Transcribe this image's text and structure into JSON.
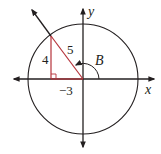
{
  "diagram": {
    "type": "unit-circle-reference-triangle",
    "colors": {
      "axis": "#231f20",
      "circle": "#231f20",
      "triangle": "#b5323a",
      "text": "#231f20"
    },
    "axes": {
      "x_label": "x",
      "y_label": "y"
    },
    "angle": {
      "label": "B",
      "quadrant": "II"
    },
    "triangle": {
      "opposite_label": "4",
      "adjacent_label": "−3",
      "hypotenuse_label": "5",
      "right_angle_marker": true
    }
  }
}
